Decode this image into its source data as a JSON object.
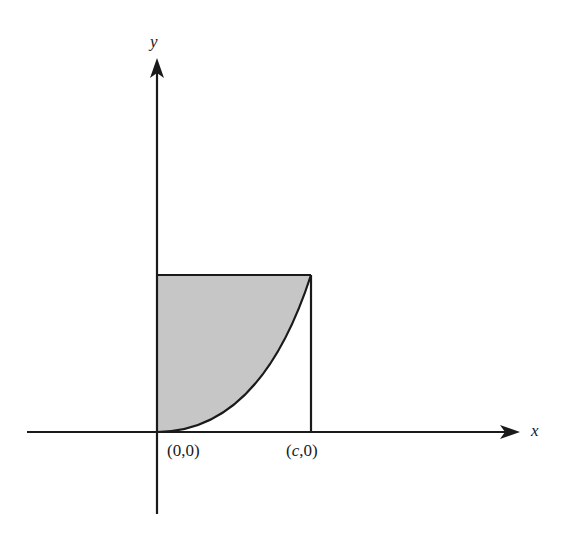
{
  "diagram": {
    "type": "area-under-curve-figure",
    "axes": {
      "x_label": "x",
      "y_label": "y"
    },
    "points": {
      "origin": "(0,0)",
      "c_point_prefix": "(",
      "c_point_var": "c",
      "c_point_suffix": ",0)"
    },
    "shaded_region": "region between y-axis, curve, and top edge of rectangle",
    "colors": {
      "stroke": "#1a1a1a",
      "fill": "#c6c6c6",
      "background": "#ffffff"
    }
  }
}
